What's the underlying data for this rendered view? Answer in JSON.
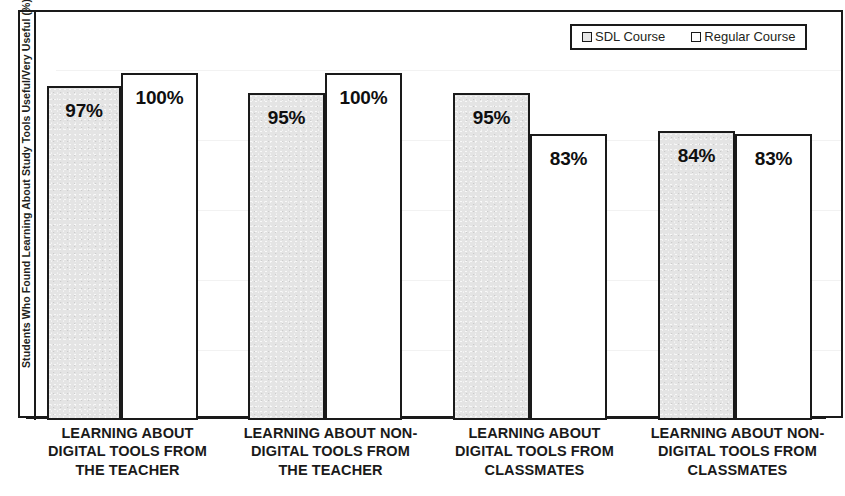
{
  "chart_data": {
    "type": "bar",
    "title": "",
    "subtitle": "",
    "xlabel": "",
    "ylabel": "Students Who Found Learning About Study Tools Useful/Very Useful (%)",
    "ylim": [
      0,
      100
    ],
    "grid": false,
    "legend_position": "top-right",
    "categories": [
      "LEARNING ABOUT DIGITAL TOOLS FROM THE TEACHER",
      "LEARNING ABOUT NON-DIGITAL TOOLS FROM THE TEACHER",
      "LEARNING ABOUT DIGITAL TOOLS FROM CLASSMATES",
      "LEARNING ABOUT NON-DIGITAL TOOLS FROM CLASSMATES"
    ],
    "category_lines": [
      [
        "LEARNING ABOUT",
        "DIGITAL TOOLS FROM",
        "THE TEACHER"
      ],
      [
        "LEARNING ABOUT NON-",
        "DIGITAL TOOLS FROM",
        "THE TEACHER"
      ],
      [
        "LEARNING ABOUT",
        "DIGITAL TOOLS FROM",
        "CLASSMATES"
      ],
      [
        "LEARNING ABOUT NON-",
        "DIGITAL TOOLS FROM",
        "CLASSMATES"
      ]
    ],
    "series": [
      {
        "name": "SDL Course",
        "color": "#e4e4e4",
        "values": [
          97,
          95,
          95,
          84
        ],
        "labels": [
          "97%",
          "95%",
          "95%",
          "84%"
        ]
      },
      {
        "name": "Regular Course",
        "color": "#ffffff",
        "values": [
          100,
          100,
          83,
          83
        ],
        "labels": [
          "100%",
          "100%",
          "83%",
          "83%"
        ]
      }
    ]
  },
  "legend": {
    "items": [
      {
        "label": "SDL Course",
        "swatch": "sdl"
      },
      {
        "label": "Regular Course",
        "swatch": "regular"
      }
    ]
  },
  "bars": [
    {
      "group": 0,
      "series": 0,
      "label": "97%",
      "left": 47,
      "width": 74,
      "top": 86,
      "height": 334
    },
    {
      "group": 0,
      "series": 1,
      "label": "100%",
      "left": 121,
      "width": 77,
      "top": 73,
      "height": 347
    },
    {
      "group": 1,
      "series": 0,
      "label": "95%",
      "left": 248,
      "width": 77,
      "top": 93,
      "height": 327
    },
    {
      "group": 1,
      "series": 1,
      "label": "100%",
      "left": 325,
      "width": 77,
      "top": 73,
      "height": 347
    },
    {
      "group": 2,
      "series": 0,
      "label": "95%",
      "left": 453,
      "width": 77,
      "top": 93,
      "height": 327
    },
    {
      "group": 2,
      "series": 1,
      "label": "83%",
      "left": 530,
      "width": 77,
      "top": 134,
      "height": 286
    },
    {
      "group": 3,
      "series": 0,
      "label": "84%",
      "left": 658,
      "width": 77,
      "top": 131,
      "height": 289
    },
    {
      "group": 3,
      "series": 1,
      "label": "83%",
      "left": 735,
      "width": 77,
      "top": 134,
      "height": 286
    }
  ],
  "category_positions": [
    {
      "left": 30,
      "width": 195
    },
    {
      "left": 228,
      "width": 205
    },
    {
      "left": 437,
      "width": 195
    },
    {
      "left": 635,
      "width": 205
    }
  ]
}
